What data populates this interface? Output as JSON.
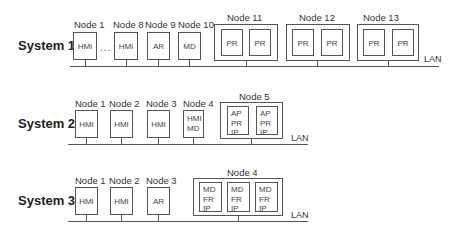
{
  "systems": [
    {
      "label": "System 1",
      "lan_label": "LAN",
      "ellipsis": "...",
      "nodes": [
        {
          "label": "Node 1",
          "roles": [
            "HMI"
          ]
        },
        {
          "label": "Node 8",
          "roles": [
            "HMI"
          ]
        },
        {
          "label": "Node 9",
          "roles": [
            "AR"
          ]
        },
        {
          "label": "Node 10",
          "roles": [
            "MD"
          ]
        },
        {
          "label": "Node 11",
          "units": [
            [
              "PR"
            ],
            [
              "PR"
            ]
          ]
        },
        {
          "label": "Node 12",
          "units": [
            [
              "PR"
            ],
            [
              "PR"
            ]
          ]
        },
        {
          "label": "Node 13",
          "units": [
            [
              "PR"
            ],
            [
              "PR"
            ]
          ]
        }
      ]
    },
    {
      "label": "System 2",
      "lan_label": "LAN",
      "nodes": [
        {
          "label": "Node 1",
          "roles": [
            "HMI"
          ]
        },
        {
          "label": "Node 2",
          "roles": [
            "HMI"
          ]
        },
        {
          "label": "Node 3",
          "roles": [
            "HMI"
          ]
        },
        {
          "label": "Node 4",
          "roles": [
            "HMI",
            "MD"
          ]
        },
        {
          "label": "Node 5",
          "units": [
            [
              "AP",
              "PR",
              "IP"
            ],
            [
              "AP",
              "PR",
              "IP"
            ]
          ]
        }
      ]
    },
    {
      "label": "System 3",
      "lan_label": "LAN",
      "nodes": [
        {
          "label": "Node 1",
          "roles": [
            "HMI"
          ]
        },
        {
          "label": "Node 2",
          "roles": [
            "HMI"
          ]
        },
        {
          "label": "Node 3",
          "roles": [
            "AR"
          ]
        },
        {
          "label": "Node 4",
          "units": [
            [
              "MD",
              "FR",
              "IP"
            ],
            [
              "MD",
              "FR",
              "IP"
            ],
            [
              "MD",
              "FR",
              "IP"
            ]
          ]
        }
      ]
    }
  ]
}
